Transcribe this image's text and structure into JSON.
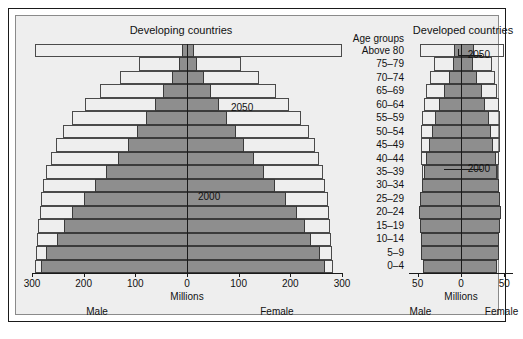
{
  "chart_data": {
    "type": "bar",
    "subtype": "population-pyramid",
    "title": "",
    "panels": [
      {
        "id": "developing",
        "title": "Developing countries",
        "xlabel": "Millions",
        "left_label": "Male",
        "right_label": "Female",
        "xlim": [
          -300,
          300
        ],
        "ticks": [
          300,
          200,
          100,
          0,
          100,
          200,
          300
        ],
        "grid": false,
        "series": [
          {
            "name": "2000",
            "style": "filled-gray",
            "male": [
              282,
              272,
              252,
              238,
              222,
              200,
              178,
              156,
              134,
              115,
              97,
              80,
              62,
              46,
              30,
              16,
              10
            ],
            "female": [
              268,
              258,
              240,
              228,
              212,
              192,
              170,
              150,
              130,
              111,
              94,
              78,
              62,
              47,
              33,
              20,
              14
            ]
          },
          {
            "name": "2050",
            "style": "outline",
            "male": [
              295,
              292,
              290,
              288,
              285,
              282,
              278,
              272,
              264,
              254,
              240,
              222,
              198,
              168,
              130,
              92,
              295
            ],
            "female": [
              282,
              280,
              278,
              276,
              274,
              272,
              268,
              263,
              256,
              248,
              236,
              220,
              198,
              172,
              140,
              104,
              300
            ]
          }
        ]
      },
      {
        "id": "developed",
        "title": "Developed countries",
        "xlabel": "Millions",
        "left_label": "Male",
        "right_label": "Female",
        "xlim": [
          -60,
          60
        ],
        "ticks": [
          50,
          0,
          50
        ],
        "grid": false,
        "series": [
          {
            "name": "2000",
            "style": "filled-gray",
            "male": [
              44,
              46,
              46,
              47,
              48,
              47,
              45,
              43,
              40,
              37,
              34,
              30,
              25,
              20,
              14,
              9,
              8
            ],
            "female": [
              42,
              44,
              44,
              45,
              46,
              45,
              44,
              42,
              40,
              37,
              35,
              32,
              28,
              24,
              19,
              14,
              15
            ]
          },
          {
            "name": "2050",
            "style": "outline",
            "male": [
              40,
              40,
              40,
              41,
              42,
              43,
              44,
              45,
              46,
              46,
              46,
              45,
              43,
              40,
              36,
              31,
              47
            ],
            "female": [
              38,
              38,
              38,
              39,
              40,
              41,
              42,
              43,
              44,
              45,
              45,
              45,
              44,
              42,
              39,
              36,
              50
            ]
          }
        ]
      }
    ],
    "age_heading": "Age groups",
    "age_groups": [
      "0–4",
      "5–9",
      "10–14",
      "15–19",
      "20–24",
      "25–29",
      "30–34",
      "35–39",
      "40–44",
      "45–49",
      "50–54",
      "55–59",
      "60–64",
      "65–69",
      "70–74",
      "75–79",
      "Above 80"
    ],
    "annotations": [
      {
        "id": "developing-2050",
        "text": "2050"
      },
      {
        "id": "developing-2000",
        "text": "2000"
      },
      {
        "id": "developed-2050",
        "text": "2050"
      },
      {
        "id": "developed-2000",
        "text": "2000"
      }
    ],
    "colors": {
      "bar_fill_2000": "#8e8e8e",
      "bar_stroke": "#3a3a3a",
      "outline_2050": "#4a4a4a",
      "axis": "#1a1a1a",
      "panel_background": "#eeeeee",
      "figure_background": "#ffffff"
    }
  }
}
